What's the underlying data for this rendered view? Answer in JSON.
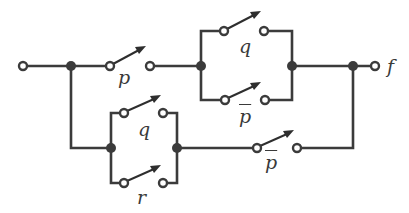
{
  "diagram": {
    "type": "switching-circuit",
    "colors": {
      "wire": "#3b3b3b",
      "background": "#ffffff"
    },
    "labels": {
      "output": "f",
      "switch_p": "p",
      "switch_q_top": "q",
      "switch_pbar_top": "p",
      "switch_q_bottom": "q",
      "switch_r": "r",
      "switch_pbar_bottom": "p"
    },
    "switches": [
      {
        "id": "p",
        "label": "p",
        "negated": false
      },
      {
        "id": "q1",
        "label": "q",
        "negated": false
      },
      {
        "id": "pbar1",
        "label": "p",
        "negated": true
      },
      {
        "id": "q2",
        "label": "q",
        "negated": false
      },
      {
        "id": "r",
        "label": "r",
        "negated": false
      },
      {
        "id": "pbar2",
        "label": "p",
        "negated": true
      }
    ]
  }
}
